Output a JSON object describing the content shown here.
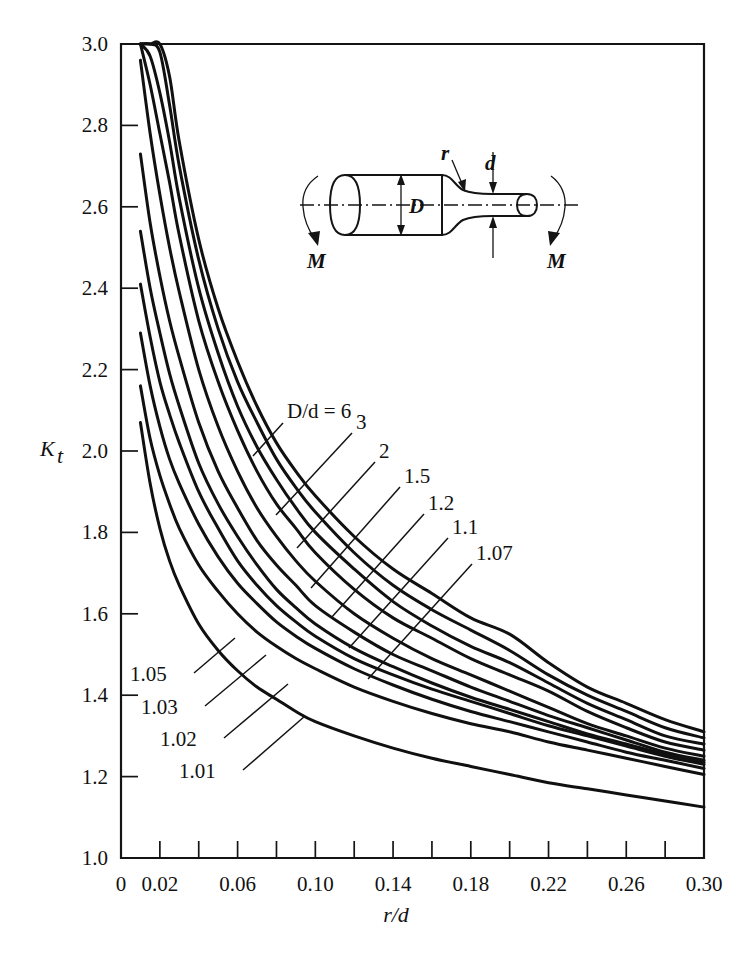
{
  "chart_data": {
    "type": "line",
    "title": "",
    "xlabel": "r/d",
    "ylabel": "Kt",
    "ylabel_base": "K",
    "ylabel_sub": "t",
    "xlim": [
      0,
      0.3
    ],
    "ylim": [
      1.0,
      3.0
    ],
    "grid": false,
    "legend_position": "inline-labels",
    "x_ticks_major": [
      0,
      0.02,
      0.06,
      0.1,
      0.14,
      0.18,
      0.22,
      0.26,
      0.3
    ],
    "x_tick_labels": [
      "0",
      "0.02",
      "0.06",
      "0.10",
      "0.14",
      "0.18",
      "0.22",
      "0.26",
      "0.30"
    ],
    "x_ticks_all": [
      0.02,
      0.04,
      0.06,
      0.08,
      0.1,
      0.12,
      0.14,
      0.16,
      0.18,
      0.2,
      0.22,
      0.24,
      0.26,
      0.28,
      0.3
    ],
    "y_ticks": [
      1.0,
      1.2,
      1.4,
      1.6,
      1.8,
      2.0,
      2.2,
      2.4,
      2.6,
      2.8,
      3.0
    ],
    "y_tick_labels": [
      "1.0",
      "1.2",
      "1.4",
      "1.6",
      "1.8",
      "2.0",
      "2.2",
      "2.4",
      "2.6",
      "2.8",
      "3.0"
    ],
    "series_legend_prefix": "D/d =",
    "x": [
      0.01,
      0.015,
      0.02,
      0.025,
      0.03,
      0.04,
      0.05,
      0.06,
      0.07,
      0.08,
      0.09,
      0.1,
      0.12,
      0.14,
      0.16,
      0.18,
      0.2,
      0.22,
      0.24,
      0.26,
      0.28,
      0.3
    ],
    "series": [
      {
        "name": "6",
        "label": "D/d = 6",
        "values": [
          3.0,
          3.0,
          3.0,
          2.92,
          2.76,
          2.52,
          2.35,
          2.22,
          2.11,
          2.02,
          1.95,
          1.89,
          1.79,
          1.71,
          1.65,
          1.59,
          1.55,
          1.48,
          1.42,
          1.38,
          1.34,
          1.31
        ]
      },
      {
        "name": "3",
        "label": "3",
        "values": [
          3.0,
          3.0,
          2.98,
          2.85,
          2.7,
          2.47,
          2.3,
          2.17,
          2.07,
          1.98,
          1.91,
          1.85,
          1.75,
          1.67,
          1.61,
          1.56,
          1.51,
          1.45,
          1.4,
          1.36,
          1.32,
          1.295
        ]
      },
      {
        "name": "2",
        "label": "2",
        "values": [
          3.0,
          2.97,
          2.88,
          2.76,
          2.62,
          2.4,
          2.24,
          2.11,
          2.01,
          1.93,
          1.86,
          1.8,
          1.71,
          1.63,
          1.57,
          1.52,
          1.48,
          1.43,
          1.38,
          1.34,
          1.3,
          1.28
        ]
      },
      {
        "name": "1.5",
        "label": "1.5",
        "values": [
          3.0,
          2.9,
          2.78,
          2.66,
          2.53,
          2.32,
          2.17,
          2.05,
          1.95,
          1.87,
          1.81,
          1.75,
          1.66,
          1.59,
          1.54,
          1.49,
          1.45,
          1.41,
          1.36,
          1.32,
          1.285,
          1.265
        ]
      },
      {
        "name": "1.2",
        "label": "1.2",
        "values": [
          2.96,
          2.78,
          2.63,
          2.5,
          2.39,
          2.2,
          2.06,
          1.95,
          1.86,
          1.79,
          1.73,
          1.68,
          1.6,
          1.54,
          1.49,
          1.45,
          1.41,
          1.37,
          1.33,
          1.3,
          1.27,
          1.25
        ]
      },
      {
        "name": "1.1",
        "label": "1.1",
        "values": [
          2.73,
          2.56,
          2.43,
          2.32,
          2.23,
          2.07,
          1.95,
          1.86,
          1.78,
          1.72,
          1.67,
          1.62,
          1.555,
          1.5,
          1.46,
          1.42,
          1.385,
          1.35,
          1.32,
          1.29,
          1.26,
          1.24
        ]
      },
      {
        "name": "1.07",
        "label": "1.07",
        "values": [
          2.54,
          2.4,
          2.29,
          2.19,
          2.11,
          1.97,
          1.87,
          1.79,
          1.72,
          1.66,
          1.615,
          1.575,
          1.515,
          1.47,
          1.43,
          1.395,
          1.365,
          1.335,
          1.305,
          1.28,
          1.255,
          1.235
        ]
      },
      {
        "name": "1.05",
        "label": "1.05",
        "values": [
          2.41,
          2.28,
          2.17,
          2.09,
          2.02,
          1.9,
          1.81,
          1.73,
          1.67,
          1.62,
          1.58,
          1.545,
          1.49,
          1.45,
          1.415,
          1.385,
          1.355,
          1.325,
          1.3,
          1.275,
          1.25,
          1.23
        ]
      },
      {
        "name": "1.03",
        "label": "1.03",
        "values": [
          2.29,
          2.16,
          2.06,
          1.98,
          1.92,
          1.82,
          1.74,
          1.675,
          1.625,
          1.58,
          1.545,
          1.515,
          1.465,
          1.425,
          1.39,
          1.36,
          1.335,
          1.31,
          1.285,
          1.26,
          1.24,
          1.22
        ]
      },
      {
        "name": "1.02",
        "label": "1.02",
        "values": [
          2.16,
          2.03,
          1.94,
          1.87,
          1.81,
          1.72,
          1.655,
          1.6,
          1.555,
          1.52,
          1.49,
          1.465,
          1.42,
          1.385,
          1.355,
          1.33,
          1.31,
          1.285,
          1.265,
          1.245,
          1.225,
          1.205
        ]
      },
      {
        "name": "1.01",
        "label": "1.01",
        "values": [
          2.07,
          1.92,
          1.81,
          1.73,
          1.67,
          1.575,
          1.51,
          1.46,
          1.42,
          1.39,
          1.36,
          1.335,
          1.3,
          1.27,
          1.245,
          1.225,
          1.205,
          1.185,
          1.17,
          1.155,
          1.14,
          1.125
        ]
      }
    ],
    "annotations": [
      {
        "text": "D/d = 6",
        "series": "6"
      },
      {
        "text": "3",
        "series": "3"
      },
      {
        "text": "2",
        "series": "2"
      },
      {
        "text": "1.5",
        "series": "1.5"
      },
      {
        "text": "1.2",
        "series": "1.2"
      },
      {
        "text": "1.1",
        "series": "1.1"
      },
      {
        "text": "1.07",
        "series": "1.07"
      },
      {
        "text": "1.05",
        "series": "1.05"
      },
      {
        "text": "1.03",
        "series": "1.03"
      },
      {
        "text": "1.02",
        "series": "1.02"
      },
      {
        "text": "1.01",
        "series": "1.01"
      }
    ]
  },
  "axis": {
    "y_title_base": "K",
    "y_title_sub": "t",
    "x_title": "r/d",
    "x_tick_labels": [
      "0",
      "0.02",
      "0.06",
      "0.10",
      "0.14",
      "0.18",
      "0.22",
      "0.26",
      "0.30"
    ],
    "y_tick_labels": [
      "3.0",
      "2.8",
      "2.6",
      "2.4",
      "2.2",
      "2.0",
      "1.8",
      "1.6",
      "1.4",
      "1.2",
      "1.0"
    ]
  },
  "curve_labels": {
    "l6": "D/d = 6",
    "l3": "3",
    "l2": "2",
    "l15": "1.5",
    "l12": "1.2",
    "l11": "1.1",
    "l107": "1.07",
    "l105": "1.05",
    "l103": "1.03",
    "l102": "1.02",
    "l101": "1.01"
  },
  "inset": {
    "label_D": "D",
    "label_d": "d",
    "label_r": "r",
    "label_M_left": "M",
    "label_M_right": "M"
  },
  "colors": {
    "curve": "#101010",
    "axis": "#141414",
    "background": "#ffffff"
  }
}
